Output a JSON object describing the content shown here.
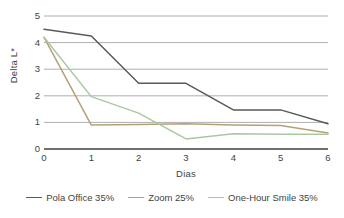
{
  "chart_data": {
    "type": "line",
    "title": "",
    "xlabel": "Dias",
    "ylabel": "Delta L*",
    "x": [
      0,
      1,
      2,
      3,
      4,
      5,
      6
    ],
    "categories": [
      "0",
      "1",
      "2",
      "3",
      "4",
      "5",
      "6"
    ],
    "xlim": [
      0,
      6
    ],
    "ylim": [
      0,
      5
    ],
    "y_ticks": [
      "0",
      "1",
      "2",
      "3",
      "4",
      "5"
    ],
    "y_tick_values": [
      0,
      1,
      2,
      3,
      4,
      5
    ],
    "grid": "horizontal",
    "legend_position": "bottom",
    "series": [
      {
        "name": "Pola Office 35%",
        "color": "#5a5a5a",
        "values": [
          4.5,
          4.25,
          2.47,
          2.47,
          1.47,
          1.47,
          0.95
        ]
      },
      {
        "name": "Zoom 25%",
        "color": "#b5a176",
        "values": [
          4.2,
          0.9,
          0.92,
          0.95,
          0.9,
          0.88,
          0.6
        ]
      },
      {
        "name": "One-Hour Smile 35%",
        "color": "#a8c9a0",
        "values": [
          4.2,
          1.97,
          1.35,
          0.38,
          0.57,
          0.55,
          0.55
        ]
      }
    ],
    "colors": {
      "grid_line": "#9a9a9a",
      "axis_line": "#3f3f3f",
      "text": "#3f3f3f",
      "background": "#ffffff"
    }
  }
}
